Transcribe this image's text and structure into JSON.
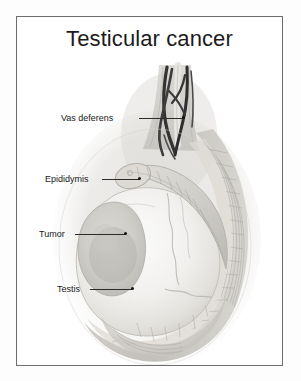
{
  "figure": {
    "title": "Testicular cancer",
    "frame_color": "#6d6d6d",
    "background_color": "#ffffff",
    "text_color": "#181818"
  },
  "labels": [
    {
      "id": "vas-deferens",
      "text": "Vas deferens",
      "text_x": 44,
      "text_y": 96,
      "line_x": 122,
      "line_y": 101,
      "line_w": 44,
      "dot_x": 165,
      "dot_y": 100,
      "has_dot": true
    },
    {
      "id": "epididymis",
      "text": "Epididymis",
      "text_x": 28,
      "text_y": 157,
      "line_x": 85,
      "line_y": 162,
      "line_w": 37,
      "dot_x": 121,
      "dot_y": 161,
      "has_dot": true
    },
    {
      "id": "tumor",
      "text": "Tumor",
      "text_x": 22,
      "text_y": 212,
      "line_x": 58,
      "line_y": 217,
      "line_w": 50,
      "dot_x": 107,
      "dot_y": 216,
      "has_dot": true
    },
    {
      "id": "testis",
      "text": "Testis",
      "text_x": 40,
      "text_y": 267,
      "line_x": 73,
      "line_y": 272,
      "line_w": 42,
      "dot_x": 114,
      "dot_y": 271,
      "has_dot": true
    }
  ],
  "anatomy": {
    "structures": [
      "scrotal-wall",
      "spermatic-cord",
      "vas-deferens-duct",
      "pampiniform-vessels",
      "epididymis-head",
      "epididymis-body",
      "tunica-vaginalis",
      "testis-body",
      "tumor-mass"
    ],
    "palette": {
      "page": "#ffffff",
      "scrotum_outer": "#c9c7c2",
      "scrotum_mid": "#b4b1ab",
      "scrotum_inner": "#dedcd7",
      "testis_light": "#f4f3f1",
      "testis_shadow": "#d8d6d1",
      "tumor_fill": "#c5c3bf",
      "tumor_core": "#b0aeaa",
      "epididymis": "#d4d2cc",
      "vessel_dark": "#2f2f2f",
      "vessel_mid": "#5a5a5a",
      "cord_light": "#cfcdc8"
    }
  }
}
